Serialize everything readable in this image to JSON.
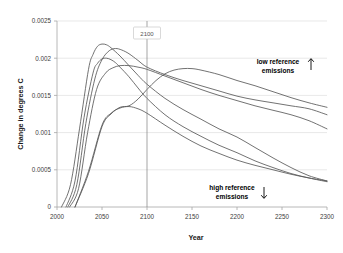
{
  "chart_data": {
    "type": "line",
    "title": "",
    "xlabel": "Year",
    "ylabel": "Change in degrees C",
    "xlim": [
      2000,
      2300
    ],
    "ylim": [
      0,
      0.0025
    ],
    "grid": true,
    "legend": "none",
    "xticks": [
      "2000",
      "2050",
      "2100",
      "2150",
      "2200",
      "2250",
      "2300"
    ],
    "xtick_values": [
      2000,
      2050,
      2100,
      2150,
      2200,
      2250,
      2300
    ],
    "yticks": [
      "0",
      "0.0005",
      "0.001",
      "0.0015",
      "0.002",
      "0.0025"
    ],
    "ytick_values": [
      0,
      0.0005,
      0.001,
      0.0015,
      0.002,
      0.0025
    ],
    "annotations": [
      {
        "name": "low-reference-emissions",
        "line1": "low reference",
        "line2": "emissions",
        "arrow": "up"
      },
      {
        "name": "high-reference-emissions",
        "line1": "high reference",
        "line2": "emissions",
        "arrow": "down"
      },
      {
        "name": "year-marker",
        "label": "2100",
        "x": 2100
      }
    ],
    "series": [
      {
        "name": "curve-1-early-peak",
        "color": "#595959",
        "x": [
          2005,
          2015,
          2025,
          2035,
          2040,
          2045,
          2050,
          2055,
          2060,
          2070,
          2080,
          2090,
          2100,
          2120,
          2140,
          2160,
          2180,
          2200,
          2220,
          2240,
          2260,
          2280,
          2300
        ],
        "y": [
          0.0,
          0.0003,
          0.00105,
          0.00185,
          0.00205,
          0.00216,
          0.00219,
          0.00218,
          0.00214,
          0.00203,
          0.0019,
          0.00177,
          0.00165,
          0.00146,
          0.00131,
          0.00118,
          0.00105,
          0.00094,
          0.0008,
          0.00066,
          0.00053,
          0.00042,
          0.00035
        ]
      },
      {
        "name": "curve-2-peak-2055",
        "color": "#595959",
        "x": [
          2010,
          2020,
          2030,
          2040,
          2045,
          2050,
          2055,
          2060,
          2065,
          2070,
          2080,
          2090,
          2100,
          2120,
          2140,
          2160,
          2180,
          2200,
          2220,
          2240,
          2260,
          2280,
          2300
        ],
        "y": [
          0.0,
          0.00035,
          0.0012,
          0.0018,
          0.00193,
          0.00199,
          0.002,
          0.00198,
          0.00194,
          0.00188,
          0.00175,
          0.0016,
          0.00146,
          0.00124,
          0.00108,
          0.00095,
          0.00083,
          0.00073,
          0.00062,
          0.00053,
          0.00045,
          0.00039,
          0.00034
        ]
      },
      {
        "name": "curve-3-peak-2065",
        "color": "#7a7a7a",
        "x": [
          2012,
          2022,
          2032,
          2042,
          2050,
          2058,
          2065,
          2072,
          2080,
          2090,
          2100,
          2120,
          2140,
          2160,
          2180,
          2200,
          2220,
          2240,
          2260,
          2280,
          2300
        ],
        "y": [
          0.0,
          0.0003,
          0.00112,
          0.00172,
          0.00198,
          0.0021,
          0.00213,
          0.00211,
          0.00206,
          0.00197,
          0.00188,
          0.00178,
          0.0017,
          0.00163,
          0.00156,
          0.00149,
          0.00144,
          0.0014,
          0.00136,
          0.00132,
          0.00124
        ]
      },
      {
        "name": "curve-4-plateau-high",
        "color": "#6e6e6e",
        "x": [
          2014,
          2024,
          2034,
          2044,
          2054,
          2062,
          2070,
          2080,
          2090,
          2100,
          2120,
          2140,
          2160,
          2180,
          2200,
          2220,
          2240,
          2260,
          2280,
          2300
        ],
        "y": [
          0.0,
          0.00025,
          0.001,
          0.00158,
          0.0018,
          0.00187,
          0.0019,
          0.0019,
          0.00188,
          0.00185,
          0.00176,
          0.00167,
          0.00158,
          0.0015,
          0.00143,
          0.00136,
          0.0013,
          0.00124,
          0.00116,
          0.00105
        ]
      },
      {
        "name": "curve-5-late-peak-2140",
        "color": "#595959",
        "x": [
          2020,
          2035,
          2050,
          2060,
          2070,
          2080,
          2090,
          2100,
          2110,
          2120,
          2130,
          2140,
          2150,
          2160,
          2180,
          2200,
          2220,
          2240,
          2260,
          2280,
          2300
        ],
        "y": [
          0.0,
          0.00045,
          0.00108,
          0.00125,
          0.00134,
          0.00136,
          0.00145,
          0.00158,
          0.0017,
          0.00179,
          0.00184,
          0.00186,
          0.00186,
          0.00184,
          0.00178,
          0.0017,
          0.00163,
          0.00155,
          0.00147,
          0.0014,
          0.00134
        ]
      },
      {
        "name": "curve-6-low-decline",
        "color": "#666666",
        "x": [
          2020,
          2035,
          2050,
          2060,
          2070,
          2080,
          2090,
          2100,
          2120,
          2140,
          2160,
          2180,
          2200,
          2220,
          2240,
          2260,
          2280,
          2300
        ],
        "y": [
          0.0,
          0.00048,
          0.0011,
          0.00126,
          0.00133,
          0.00135,
          0.00132,
          0.00126,
          0.0011,
          0.00095,
          0.00082,
          0.00072,
          0.00063,
          0.00056,
          0.0005,
          0.00044,
          0.00039,
          0.00035
        ]
      }
    ]
  }
}
